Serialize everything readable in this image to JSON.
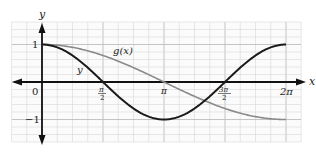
{
  "chart_data": {
    "type": "line",
    "title": "",
    "xlabel": "x",
    "ylabel": "y",
    "xlim": [
      0,
      6.2832
    ],
    "ylim": [
      -1.4,
      1.4
    ],
    "grid": true,
    "x_ticks": [
      {
        "value": 0,
        "label": "0"
      },
      {
        "value": 1.5708,
        "label": "π/2"
      },
      {
        "value": 3.1416,
        "label": "π"
      },
      {
        "value": 4.7124,
        "label": "3π/2"
      },
      {
        "value": 6.2832,
        "label": "2π"
      }
    ],
    "y_ticks": [
      {
        "value": 1,
        "label": "1"
      },
      {
        "value": -1,
        "label": "−1"
      }
    ],
    "series": [
      {
        "name": "y",
        "expression": "cos(x)",
        "color": "#1a1a1a",
        "x": [
          0,
          0.7854,
          1.5708,
          2.3562,
          3.1416,
          3.927,
          4.7124,
          5.4978,
          6.2832
        ],
        "values": [
          1,
          0.707,
          0,
          -0.707,
          -1,
          -0.707,
          0,
          0.707,
          1
        ]
      },
      {
        "name": "g(x)",
        "expression": "cos(x/2)",
        "color": "#8a8a8a",
        "x": [
          0,
          0.7854,
          1.5708,
          2.3562,
          3.1416,
          3.927,
          4.7124,
          5.4978,
          6.2832
        ],
        "values": [
          1,
          0.924,
          0.707,
          0.383,
          0,
          -0.383,
          -0.707,
          -0.924,
          -1
        ]
      }
    ],
    "annotations": [
      {
        "text": "g(x)",
        "near": "gray curve"
      },
      {
        "text": "y",
        "near": "dark curve"
      }
    ]
  },
  "labels": {
    "x_axis": "x",
    "y_axis": "y",
    "origin": "0",
    "y_one": "1",
    "y_neg_one": "−1",
    "curve_g": "g(x)",
    "curve_y": "y",
    "tick_pi_half_num": "π",
    "tick_pi_half_den": "2",
    "tick_pi": "π",
    "tick_3pi_half_num": "3π",
    "tick_3pi_half_den": "2",
    "tick_2pi": "2π"
  }
}
